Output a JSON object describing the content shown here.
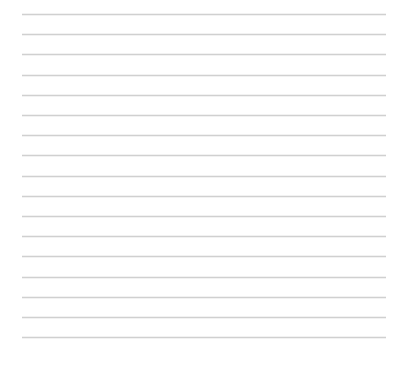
{
  "page": {
    "name": "blank-ruled-sheet",
    "width": 407,
    "height": 367,
    "background_color": "#ffffff",
    "content_text": ""
  },
  "rules": {
    "count": 17,
    "color": "#d0d0d0",
    "thickness_px": 1,
    "left_px": 22,
    "right_px": 386,
    "first_line_y_px": 14,
    "spacing_px": 20.2,
    "lines": [
      {
        "index": 1,
        "y": 14,
        "text": ""
      },
      {
        "index": 2,
        "y": 34,
        "text": ""
      },
      {
        "index": 3,
        "y": 54,
        "text": ""
      },
      {
        "index": 4,
        "y": 75,
        "text": ""
      },
      {
        "index": 5,
        "y": 95,
        "text": ""
      },
      {
        "index": 6,
        "y": 115,
        "text": ""
      },
      {
        "index": 7,
        "y": 135,
        "text": ""
      },
      {
        "index": 8,
        "y": 155,
        "text": ""
      },
      {
        "index": 9,
        "y": 176,
        "text": ""
      },
      {
        "index": 10,
        "y": 196,
        "text": ""
      },
      {
        "index": 11,
        "y": 216,
        "text": ""
      },
      {
        "index": 12,
        "y": 236,
        "text": ""
      },
      {
        "index": 13,
        "y": 256,
        "text": ""
      },
      {
        "index": 14,
        "y": 277,
        "text": ""
      },
      {
        "index": 15,
        "y": 297,
        "text": ""
      },
      {
        "index": 16,
        "y": 317,
        "text": ""
      },
      {
        "index": 17,
        "y": 337,
        "text": ""
      }
    ]
  }
}
